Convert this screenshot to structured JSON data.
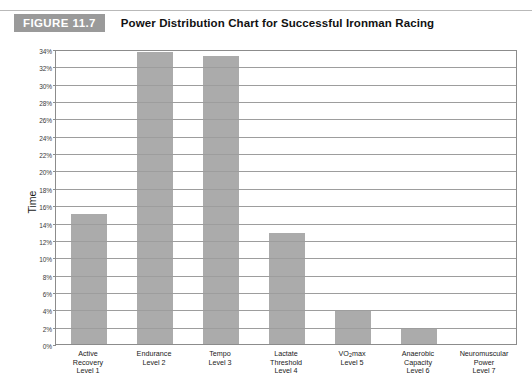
{
  "figure": {
    "badge_label": "FIGURE",
    "badge_number": "11.7",
    "title": "Power Distribution Chart for Successful Ironman Racing"
  },
  "chart_data": {
    "type": "bar",
    "title": "Power Distribution Chart for Successful Ironman Racing",
    "xlabel": "",
    "ylabel": "Time",
    "ylim": [
      0,
      34
    ],
    "ytick_step": 2,
    "grid": "horizontal",
    "legend": "none",
    "bar_color": "#ababab",
    "categories": [
      "Active Recovery Level 1",
      "Endurance Level 2",
      "Tempo Level 3",
      "Lactate Threshold Level 4",
      "VO2max Level 5",
      "Anaerobic Capacity Level 6",
      "Neuromuscular Power Level 7"
    ],
    "category_lines": [
      [
        "Active",
        "Recovery",
        "Level 1"
      ],
      [
        "Endurance",
        "Level 2"
      ],
      [
        "Tempo",
        "Level 3"
      ],
      [
        "Lactate",
        "Threshold",
        "Level 4"
      ],
      [
        "VO|2|max",
        "Level 5"
      ],
      [
        "Anaerobic",
        "Capacity",
        "Level 6"
      ],
      [
        "Neuromuscular",
        "Power",
        "Level 7"
      ]
    ],
    "values": [
      15.0,
      33.6,
      33.2,
      12.8,
      3.9,
      1.9,
      0.0
    ],
    "ytick_labels": [
      "0%",
      "2%",
      "4%",
      "6%",
      "8%",
      "10%",
      "12%",
      "14%",
      "16%",
      "18%",
      "20%",
      "22%",
      "24%",
      "26%",
      "28%",
      "30%",
      "32%",
      "34%"
    ]
  }
}
